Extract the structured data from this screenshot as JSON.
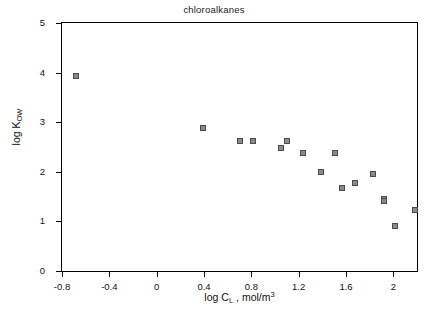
{
  "chart_data": {
    "type": "scatter",
    "title": "chloroalkanes",
    "xlabel": "log C_L , mol/m^3",
    "ylabel": "log K_OW",
    "xlim": [
      -0.8,
      2.2
    ],
    "ylim": [
      0,
      5
    ],
    "grid": false,
    "legend": null,
    "xticks": [
      -0.8,
      -0.4,
      0,
      0.4,
      0.8,
      1.2,
      1.6,
      2
    ],
    "xtick_labels": [
      "-0.8",
      "-0.4",
      "0",
      "0.4",
      "0.8",
      "1.2",
      "1.6",
      "2"
    ],
    "yticks": [
      0,
      1,
      2,
      3,
      4,
      5
    ],
    "ytick_labels": [
      "0",
      "1",
      "2",
      "3",
      "4",
      "5"
    ],
    "marker": "square",
    "marker_color": "#8a8a8a",
    "marker_edge_color": "#4a4a4a",
    "points": [
      {
        "x": -0.68,
        "y": 3.93
      },
      {
        "x": 0.39,
        "y": 2.89
      },
      {
        "x": 0.7,
        "y": 2.63
      },
      {
        "x": 0.81,
        "y": 2.63
      },
      {
        "x": 1.05,
        "y": 2.48
      },
      {
        "x": 1.1,
        "y": 2.62
      },
      {
        "x": 1.24,
        "y": 2.38
      },
      {
        "x": 1.39,
        "y": 1.99
      },
      {
        "x": 1.51,
        "y": 2.38
      },
      {
        "x": 1.57,
        "y": 1.68
      },
      {
        "x": 1.68,
        "y": 1.78
      },
      {
        "x": 1.83,
        "y": 1.96
      },
      {
        "x": 1.92,
        "y": 1.46
      },
      {
        "x": 1.92,
        "y": 1.41
      },
      {
        "x": 2.01,
        "y": 0.9
      },
      {
        "x": 2.18,
        "y": 1.23
      }
    ]
  },
  "axis_titles": {
    "x_prefix": "log C",
    "x_sub": "L",
    "x_suffix": ", mol/m",
    "x_sup": "3",
    "y_prefix": "log K",
    "y_sub": "OW"
  }
}
